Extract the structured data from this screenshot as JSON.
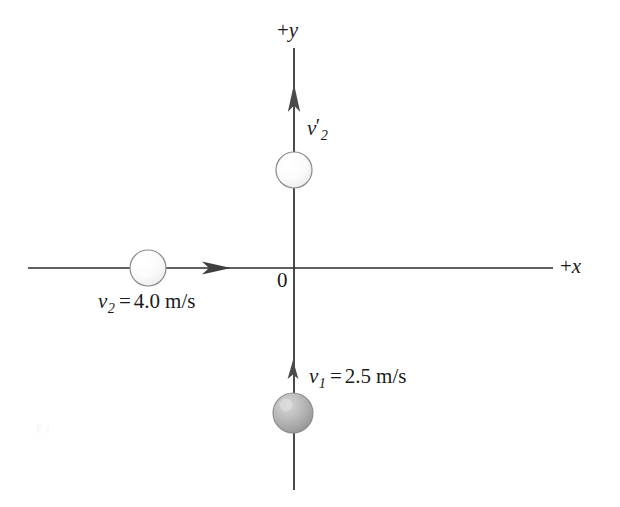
{
  "figure": {
    "background_color": "#ffffff",
    "axis_color": "#2b2b2b",
    "text_color": "#1a1a1a"
  },
  "axes": {
    "y_axis": {
      "label": "+y",
      "sign": "+",
      "name": "y",
      "orientation": "vertical",
      "x_px": 294,
      "from_y_px": 490,
      "to_y_px": 48
    },
    "x_axis": {
      "label": "+x",
      "sign": "+",
      "name": "x",
      "orientation": "horizontal",
      "y_px": 268,
      "from_x_px": 28,
      "to_x_px": 553
    },
    "origin": {
      "label": "0",
      "x_px": 294,
      "y_px": 268
    }
  },
  "balls": [
    {
      "id": "ball-v2-prime",
      "fill": "light",
      "cx": 294,
      "cy": 170,
      "r": 18
    },
    {
      "id": "ball-v2",
      "fill": "light",
      "cx": 148,
      "cy": 268,
      "r": 18
    },
    {
      "id": "ball-v1",
      "fill": "shaded",
      "cx": 293,
      "cy": 413,
      "r": 20
    }
  ],
  "vectors": [
    {
      "id": "vector-v2-prime",
      "direction": "up",
      "label_symbol": "v",
      "label_prime": "′",
      "label_subscript": "2",
      "label_full": "v′2",
      "value": null,
      "units": null,
      "tail": {
        "x": 294,
        "y": 152
      },
      "tip": {
        "x": 294,
        "y": 85
      }
    },
    {
      "id": "vector-v2",
      "direction": "right",
      "label_symbol": "v",
      "label_prime": "",
      "label_subscript": "2",
      "label_equals": "=",
      "value": "4.0",
      "units": "m/s",
      "label_full": "v2 = 4.0 m/s",
      "tail": {
        "x": 166,
        "y": 268
      },
      "tip": {
        "x": 228,
        "y": 268
      }
    },
    {
      "id": "vector-v1",
      "direction": "up",
      "label_symbol": "v",
      "label_prime": "",
      "label_subscript": "1",
      "label_equals": "=",
      "value": "2.5",
      "units": "m/s",
      "label_full": "v1 = 2.5 m/s",
      "tail": {
        "x": 293,
        "y": 395
      },
      "tip": {
        "x": 293,
        "y": 362
      }
    }
  ],
  "labels": {
    "pos_y": {
      "sign": "+",
      "axis": "y"
    },
    "pos_x": {
      "sign": "+",
      "axis": "x"
    },
    "origin": "0",
    "v2_prime": {
      "symbol": "v",
      "prime": "′",
      "sub": "2"
    },
    "v2": {
      "symbol": "v",
      "sub": "2",
      "eq": "=",
      "value": "4.0",
      "unit": "m/s"
    },
    "v1": {
      "symbol": "v",
      "sub": "1",
      "eq": "=",
      "value": "2.5",
      "unit": "m/s"
    }
  }
}
